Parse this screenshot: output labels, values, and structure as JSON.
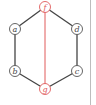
{
  "diagram": {
    "type": "graph",
    "shape": "hexagon",
    "nodes": [
      {
        "id": "f",
        "label": "f",
        "x": 45,
        "y": 7,
        "highlight": true
      },
      {
        "id": "d",
        "label": "d",
        "x": 77,
        "y": 29,
        "highlight": false
      },
      {
        "id": "c",
        "label": "c",
        "x": 77,
        "y": 71,
        "highlight": false
      },
      {
        "id": "g",
        "label": "g",
        "x": 45,
        "y": 89,
        "highlight": true
      },
      {
        "id": "b",
        "label": "b",
        "x": 15,
        "y": 71,
        "highlight": false
      },
      {
        "id": "a",
        "label": "a",
        "x": 15,
        "y": 29,
        "highlight": false
      }
    ],
    "edges": [
      {
        "from": "f",
        "to": "d",
        "color": "#444444"
      },
      {
        "from": "d",
        "to": "c",
        "color": "#444444"
      },
      {
        "from": "c",
        "to": "g",
        "color": "#444444"
      },
      {
        "from": "g",
        "to": "b",
        "color": "#444444"
      },
      {
        "from": "b",
        "to": "a",
        "color": "#444444"
      },
      {
        "from": "a",
        "to": "f",
        "color": "#444444"
      },
      {
        "from": "f",
        "to": "g",
        "color": "#e05a5a"
      }
    ],
    "colors": {
      "edge": "#444444",
      "highlight": "#e05a5a",
      "node_stroke": "#555555",
      "node_fill": "#ffffff"
    }
  }
}
